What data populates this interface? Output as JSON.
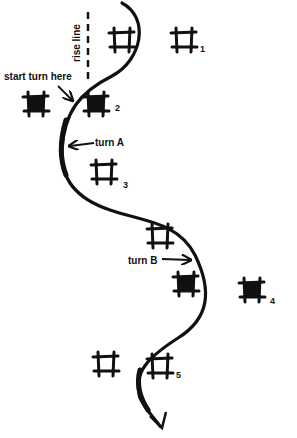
{
  "diagram": {
    "annotations": {
      "rise_line": "rise line",
      "start_turn": "start turn here",
      "turn_a": "turn A",
      "turn_b": "turn B"
    },
    "markers": [
      {
        "id": "1",
        "label": "1",
        "style": "open"
      },
      {
        "id": "2",
        "label": "2",
        "style": "filled"
      },
      {
        "id": "3",
        "label": "3",
        "style": "open"
      },
      {
        "id": "4",
        "label": "4",
        "style": "filled"
      },
      {
        "id": "5",
        "label": "5",
        "style": "open"
      }
    ],
    "extra_markers": [
      {
        "id": "top-near-path",
        "style": "open"
      },
      {
        "id": "left-of-2",
        "style": "filled"
      },
      {
        "id": "mid-before-turn-b",
        "style": "open"
      },
      {
        "id": "turn-b-inner",
        "style": "filled"
      },
      {
        "id": "left-of-5",
        "style": "open"
      }
    ],
    "colors": {
      "ink": "#111111",
      "background": "#ffffff"
    }
  }
}
